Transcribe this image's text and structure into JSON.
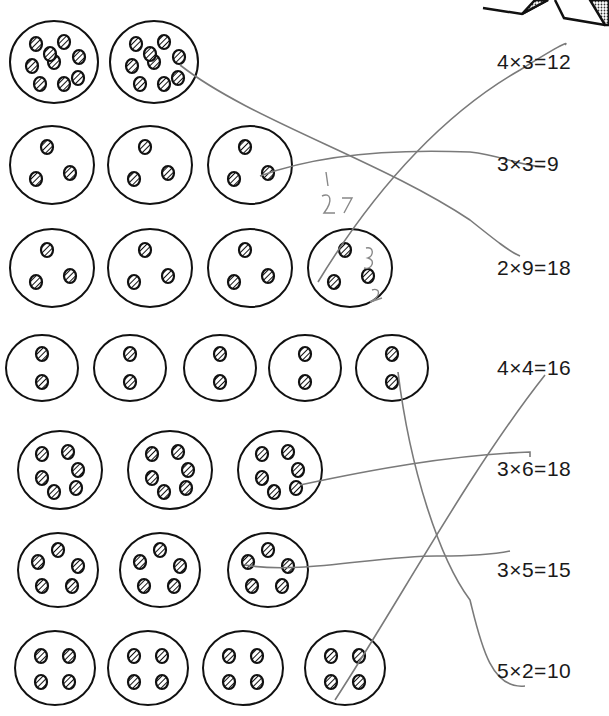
{
  "worksheet": {
    "equations": [
      {
        "text": "4×3=12",
        "x": 497,
        "y": 50
      },
      {
        "text": "3×3=9",
        "x": 497,
        "y": 152
      },
      {
        "text": "2×9=18",
        "x": 497,
        "y": 256
      },
      {
        "text": "4×4=16",
        "x": 497,
        "y": 356
      },
      {
        "text": "3×6=18",
        "x": 497,
        "y": 457
      },
      {
        "text": "3×5=15",
        "x": 497,
        "y": 558
      },
      {
        "text": "5×2=10",
        "x": 497,
        "y": 659
      }
    ],
    "handwritten_notes": [
      "1",
      "27",
      "3",
      "2"
    ],
    "rows": [
      {
        "cookies": 2,
        "chips_each": 9
      },
      {
        "cookies": 3,
        "chips_each": 3
      },
      {
        "cookies": 4,
        "chips_each": 3
      },
      {
        "cookies": 5,
        "chips_each": 2
      },
      {
        "cookies": 3,
        "chips_each": 6
      },
      {
        "cookies": 3,
        "chips_each": 5
      },
      {
        "cookies": 4,
        "chips_each": 4
      }
    ],
    "colors": {
      "ink": "#111111",
      "pencil": "#777777"
    }
  }
}
